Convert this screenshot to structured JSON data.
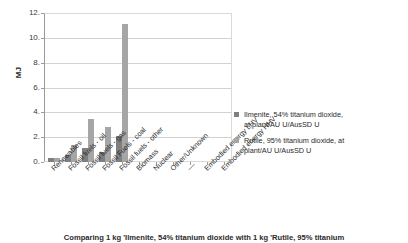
{
  "chart_data": {
    "type": "bar",
    "title": "",
    "caption": "Comparing 1 kg 'Ilmenite, 54% titanium dioxide with 1 kg 'Rutile, 95% titanium",
    "xlabel": "",
    "ylabel": "MJ",
    "ylim": [
      0,
      12
    ],
    "ytick_values": [
      0,
      2,
      4,
      6,
      8,
      10,
      12
    ],
    "ytick_labels": [
      "0.",
      "2.",
      "4.",
      "6.",
      "8.",
      "10.",
      "12."
    ],
    "grid": true,
    "legend_position": "right",
    "categories": [
      "Renewables",
      "Fossil fuels - oil",
      "Fossil fuels - gas",
      "Fossil Fuels - coal",
      "Fossil fuels - other",
      "Biomass",
      "Nuclear",
      "Other/Unknown",
      "—",
      "Embodied energy LHV",
      "Embodied energy HHV"
    ],
    "series": [
      {
        "name": "Ilmenite, 54% titanium dioxide, at plant/AU U/AusSD U",
        "color": "#7f7f7f",
        "values": [
          0.3,
          0.55,
          1.1,
          0.8,
          2.1,
          0.0,
          0.0,
          0.0,
          0.0,
          0.0,
          0.0
        ]
      },
      {
        "name": "Rutile, 95% titanium dioxide, at plant/AU U/AusSD U",
        "color": "#a6a6a6",
        "values": [
          0.35,
          1.35,
          3.5,
          2.85,
          11.1,
          0.0,
          0.0,
          0.0,
          0.0,
          0.0,
          0.0
        ]
      }
    ]
  },
  "legend": {
    "items": [
      {
        "line1": "Ilmenite, 54% titanium dioxide,",
        "line2": "at plant/AU U/AusSD U"
      },
      {
        "line1": "Rutile, 95% titanium dioxide, at",
        "line2": "plant/AU U/AusSD U"
      }
    ]
  }
}
